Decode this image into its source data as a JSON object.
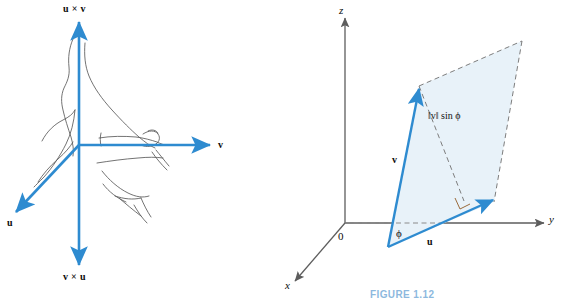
{
  "figure": {
    "domain": "diagram",
    "caption_right": "FIGURE 1.12",
    "colors": {
      "vector_blue": "#2e8bd0",
      "axis_gray": "#6f6f6f",
      "parallelogram_fill": "#e7f1f8",
      "dashed_gray": "#7a7a7a",
      "sketch_ink": "#4a4a4a",
      "caption_blue": "#2f7fc4",
      "text_black": "#0b0b0b"
    }
  },
  "left_panel": {
    "name": "right-hand-rule-diagram",
    "labels": {
      "up_axis": "u × v",
      "down_axis": "v × u",
      "right_vector": "v",
      "lower_left_vector": "u"
    },
    "sketch": "right hand with curled fingers indicating the right-hand rule"
  },
  "right_panel": {
    "name": "cross-product-area-diagram",
    "axes": {
      "z": "z",
      "y": "y",
      "x": "x",
      "origin": "0"
    },
    "labels": {
      "vector_v": "v",
      "vector_u": "u",
      "angle": "ϕ",
      "height": "‖v‖ sin ϕ"
    },
    "markers": {
      "right_angle": "right angle marker at foot of altitude"
    }
  }
}
